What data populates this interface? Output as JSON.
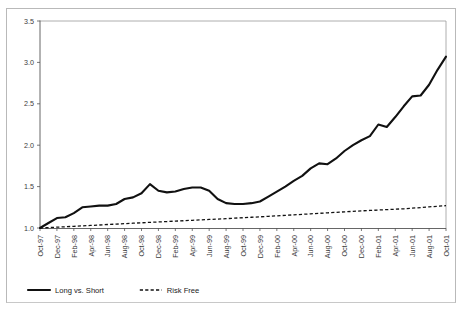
{
  "chart_data": {
    "type": "line",
    "title": "",
    "xlabel": "",
    "ylabel": "",
    "ylim": [
      1.0,
      3.5
    ],
    "ytick_values": [
      1.0,
      1.5,
      2.0,
      2.5,
      3.0,
      3.5
    ],
    "ytick_labels": [
      "1.0",
      "1.5",
      "2.0",
      "2.5",
      "3.0",
      "3.5"
    ],
    "grid": false,
    "legend_position": "bottom-left",
    "categories": [
      "Oct-97",
      "Nov-97",
      "Dec-97",
      "Jan-98",
      "Feb-98",
      "Mar-98",
      "Apr-98",
      "May-98",
      "Jun-98",
      "Jul-98",
      "Aug-98",
      "Sep-98",
      "Oct-98",
      "Nov-98",
      "Dec-98",
      "Jan-99",
      "Feb-99",
      "Mar-99",
      "Apr-99",
      "May-99",
      "Jun-99",
      "Jul-99",
      "Aug-99",
      "Sep-99",
      "Oct-99",
      "Nov-99",
      "Dec-99",
      "Jan-00",
      "Feb-00",
      "Mar-00",
      "Apr-00",
      "May-00",
      "Jun-00",
      "Jul-00",
      "Aug-00",
      "Sep-00",
      "Oct-00",
      "Nov-00",
      "Dec-00",
      "Jan-01",
      "Feb-01",
      "Mar-01",
      "Apr-01",
      "May-01",
      "Jun-01",
      "Jul-01",
      "Aug-01",
      "Sep-01",
      "Oct-01"
    ],
    "xtick_labels": [
      "Oct-97",
      "Dec-97",
      "Feb-98",
      "Apr-98",
      "Jun-98",
      "Aug-98",
      "Oct-98",
      "Dec-98",
      "Feb-99",
      "Apr-99",
      "Jun-99",
      "Aug-99",
      "Oct-99",
      "Dec-99",
      "Feb-00",
      "Apr-00",
      "Jun-00",
      "Aug-00",
      "Oct-00",
      "Dec-00",
      "Feb-01",
      "Apr-01",
      "Jun-01",
      "Aug-01",
      "Oct-01"
    ],
    "series": [
      {
        "name": "Long vs. Short",
        "style": "solid",
        "color": "#111111",
        "values": [
          1.0,
          1.06,
          1.12,
          1.13,
          1.18,
          1.25,
          1.26,
          1.27,
          1.27,
          1.29,
          1.35,
          1.37,
          1.42,
          1.53,
          1.45,
          1.43,
          1.44,
          1.47,
          1.49,
          1.49,
          1.45,
          1.35,
          1.3,
          1.29,
          1.29,
          1.3,
          1.32,
          1.38,
          1.44,
          1.5,
          1.57,
          1.63,
          1.72,
          1.78,
          1.77,
          1.84,
          1.93,
          2.0,
          2.06,
          2.11,
          2.25,
          2.22,
          2.34,
          2.47,
          2.59,
          2.6,
          2.73,
          2.91,
          3.07
        ]
      },
      {
        "name": "Risk Free",
        "style": "dotted",
        "color": "#111111",
        "values": [
          1.0,
          1.005,
          1.01,
          1.015,
          1.02,
          1.026,
          1.031,
          1.036,
          1.042,
          1.047,
          1.052,
          1.058,
          1.063,
          1.068,
          1.073,
          1.078,
          1.083,
          1.088,
          1.093,
          1.098,
          1.103,
          1.108,
          1.113,
          1.119,
          1.124,
          1.13,
          1.135,
          1.141,
          1.147,
          1.153,
          1.159,
          1.165,
          1.171,
          1.177,
          1.183,
          1.189,
          1.195,
          1.201,
          1.207,
          1.212,
          1.217,
          1.222,
          1.227,
          1.232,
          1.239,
          1.247,
          1.255,
          1.263,
          1.27
        ]
      }
    ],
    "legend": [
      {
        "label": "Long vs. Short",
        "style": "solid"
      },
      {
        "label": "Risk Free",
        "style": "dotted"
      }
    ]
  }
}
